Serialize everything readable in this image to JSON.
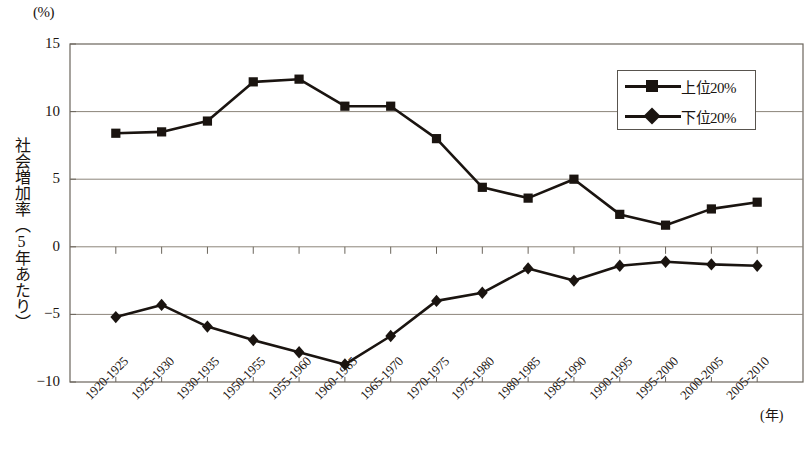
{
  "chart_data": {
    "type": "line",
    "title": "",
    "xlabel": "(年)",
    "ylabel": "社会増加率（5年あたり）",
    "yunit": "(%)",
    "ylim": [
      -10,
      15
    ],
    "yticks": [
      15,
      10,
      5,
      0,
      -5,
      -10
    ],
    "ytick_labels": [
      "15",
      "10",
      "5",
      "0",
      "-5",
      "-10"
    ],
    "grid": true,
    "legend_position": "top-right",
    "categories": [
      "1920-1925",
      "1925-1930",
      "1930-1935",
      "1950-1955",
      "1955-1960",
      "1960-1965",
      "1965-1970",
      "1970-1975",
      "1975-1980",
      "1980-1985",
      "1985-1990",
      "1990-1995",
      "1995-2000",
      "2000-2005",
      "2005-2010"
    ],
    "series": [
      {
        "name": "上位20%",
        "marker": "square",
        "color": "#1a1410",
        "values": [
          8.4,
          8.5,
          9.3,
          12.2,
          12.4,
          10.4,
          10.4,
          8.0,
          4.4,
          3.6,
          5.0,
          2.4,
          1.6,
          2.8,
          3.3
        ]
      },
      {
        "name": "下位20%",
        "marker": "diamond",
        "color": "#1a1410",
        "values": [
          -5.2,
          -4.3,
          -5.9,
          -6.9,
          -7.8,
          -8.7,
          -6.6,
          -4.0,
          -3.4,
          -1.6,
          -2.5,
          -1.4,
          -1.1,
          -1.3,
          -1.4
        ]
      }
    ]
  },
  "legend": {
    "items": [
      {
        "label": "上位20%",
        "marker": "square"
      },
      {
        "label": "下位20%",
        "marker": "diamond"
      }
    ]
  }
}
